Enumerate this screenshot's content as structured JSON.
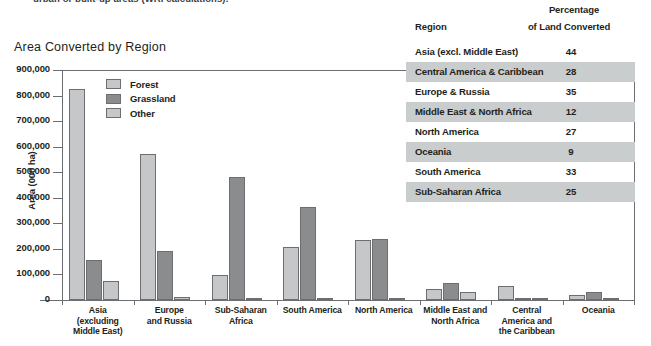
{
  "caption": "urban or built-up areas (WRI calculations).",
  "chart_title": "Area Converted by Region",
  "legend": [
    {
      "label": "Forest",
      "color": "#c6c7c9"
    },
    {
      "label": "Grassland",
      "color": "#8a8c8e"
    },
    {
      "label": "Other",
      "color": "#c6c7c9"
    }
  ],
  "yaxis": {
    "label": "Area (000 ha)",
    "ticks": [
      "900,000",
      "800,000",
      "700,000",
      "600,000",
      "500,000",
      "400,000",
      "300,000",
      "200,000",
      "100,000",
      "0"
    ]
  },
  "table": {
    "header": {
      "region": "Region",
      "percentage_line1": "Percentage",
      "percentage_line2": "of Land Converted"
    },
    "rows": [
      {
        "region": "Asia (excl. Middle East)",
        "value": "44"
      },
      {
        "region": "Central America & Caribbean",
        "value": "28"
      },
      {
        "region": "Europe & Russia",
        "value": "35"
      },
      {
        "region": "Middle East & North Africa",
        "value": "12"
      },
      {
        "region": "North America",
        "value": "27"
      },
      {
        "region": "Oceania",
        "value": "9"
      },
      {
        "region": "South America",
        "value": "33"
      },
      {
        "region": "Sub-Saharan Africa",
        "value": "25"
      }
    ]
  },
  "chart_data": {
    "type": "bar",
    "title": "Area Converted by Region",
    "xlabel": "",
    "ylabel": "Area (000 ha)",
    "ylim": [
      0,
      900000
    ],
    "ytick_step": 100000,
    "grid": false,
    "legend_position": "inside-top-left",
    "categories": [
      "Asia (excluding Middle East)",
      "Europe and Russia",
      "Sub-Saharan Africa",
      "South America",
      "North America",
      "Middle East and North Africa",
      "Central America and the Caribbean",
      "Oceania"
    ],
    "category_lines": [
      [
        "Asia",
        "(excluding",
        "Middle East)"
      ],
      [
        "Europe",
        "and Russia"
      ],
      [
        "Sub-Saharan",
        "Africa"
      ],
      [
        "South America"
      ],
      [
        "North America"
      ],
      [
        "Middle East and",
        "North Africa"
      ],
      [
        "Central",
        "America and",
        "the Caribbean"
      ],
      [
        "Oceania"
      ]
    ],
    "series": [
      {
        "name": "Forest",
        "color": "#c6c7c9",
        "values": [
          825000,
          570000,
          97000,
          207000,
          233000,
          45000,
          55000,
          20000
        ]
      },
      {
        "name": "Grassland",
        "color": "#8a8c8e",
        "values": [
          155000,
          193000,
          483000,
          365000,
          240000,
          68000,
          8000,
          32000
        ]
      },
      {
        "name": "Other",
        "color": "#c6c7c9",
        "values": [
          75000,
          10000,
          5000,
          7000,
          8000,
          33000,
          5000,
          2000
        ]
      }
    ]
  }
}
